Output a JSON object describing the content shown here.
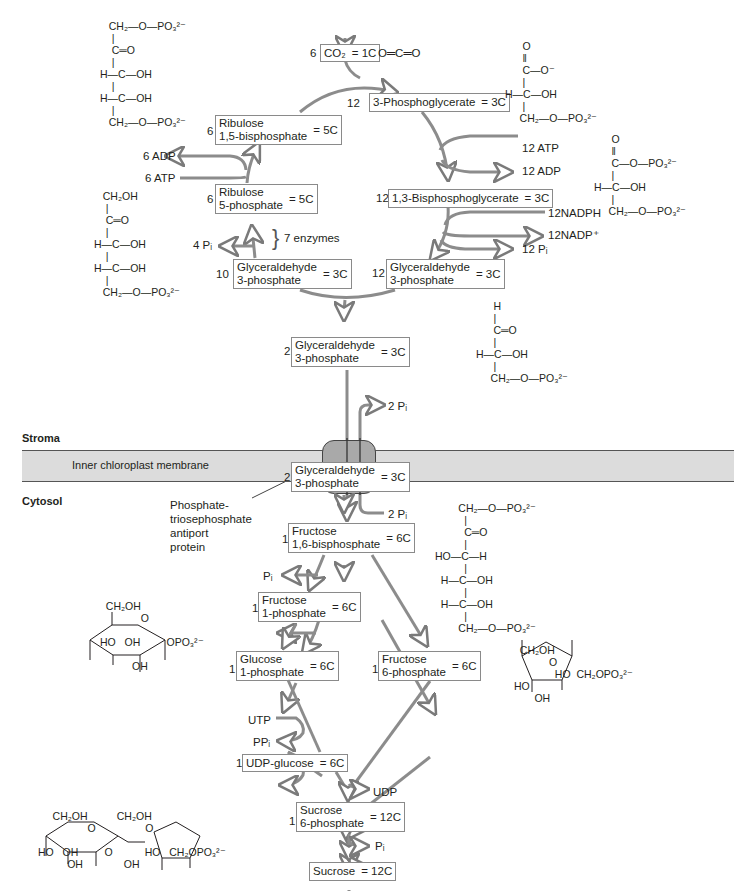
{
  "regions": {
    "stroma": "Stroma",
    "cytosol": "Cytosol",
    "membrane": "Inner chloroplast membrane",
    "antiport_label": [
      "Phosphate-",
      "triosephosphate",
      "antiport",
      "protein"
    ]
  },
  "calvin_cycle": {
    "co2": {
      "coef": "6",
      "name": "CO₂",
      "eq": "= 1C",
      "structure": "O═C═O"
    },
    "pga": {
      "coef": "12",
      "name": "3-Phosphoglycerate",
      "eq": "= 3C"
    },
    "bpg": {
      "coef": "12",
      "name": "1,3-Bisphosphoglycerate",
      "eq": "= 3C"
    },
    "g3p12": {
      "coef": "12",
      "name1": "Glyceraldehyde",
      "name2": "3-phosphate",
      "eq": "= 3C"
    },
    "g3p10": {
      "coef": "10",
      "name1": "Glyceraldehyde",
      "name2": "3-phosphate",
      "eq": "= 3C"
    },
    "ru5p": {
      "coef": "6",
      "name1": "Ribulose",
      "name2": "5-phosphate",
      "eq": "= 5C"
    },
    "rubp": {
      "coef": "6",
      "name1": "Ribulose",
      "name2": "1,5-bisphosphate",
      "eq": "= 5C"
    },
    "side": {
      "atp12": "12 ATP",
      "adp12": "12 ADP",
      "nadph": "12NADPH",
      "nadp": "12NADP⁺",
      "pi12": "12 Pᵢ",
      "adp6": "6 ADP",
      "atp6": "6 ATP",
      "pi4": "4 Pᵢ",
      "enzymes": "7 enzymes"
    }
  },
  "export": {
    "g3p_stroma": {
      "coef": "2",
      "name1": "Glyceraldehyde",
      "name2": "3-phosphate",
      "eq": "= 3C"
    },
    "pi_out": "2 Pᵢ",
    "pi_in": "2 Pᵢ",
    "g3p_cytosol": {
      "coef": "2",
      "name1": "Glyceraldehyde",
      "name2": "3-phosphate",
      "eq": "= 3C"
    }
  },
  "sucrose_pathway": {
    "f16bp": {
      "coef": "1",
      "name1": "Fructose",
      "name2": "1,6-bisphosphate",
      "eq": "= 6C"
    },
    "pi_f": "Pᵢ",
    "f1p": {
      "coef": "1",
      "name1": "Fructose",
      "name2": "1-phosphate",
      "eq": "= 6C"
    },
    "g1p": {
      "coef": "1",
      "name1": "Glucose",
      "name2": "1-phosphate",
      "eq": "= 6C"
    },
    "f6p": {
      "coef": "1",
      "name1": "Fructose",
      "name2": "6-phosphate",
      "eq": "= 6C"
    },
    "utp": "UTP",
    "ppi": "PPᵢ",
    "udpg": {
      "coef": "1",
      "name": "UDP-glucose",
      "eq": "= 6C"
    },
    "udp": "UDP",
    "s6p": {
      "coef": "1",
      "name1": "Sucrose",
      "name2": "6-phosphate",
      "eq": "= 12C"
    },
    "pi_s": "Pᵢ",
    "sucrose": {
      "name": "Sucrose",
      "eq": "= 12C"
    }
  },
  "colors": {
    "arrow": "#8c8c8c",
    "box_border": "#8a8a8a",
    "membrane": "#dcdcdc",
    "protein": "#a9a9a9",
    "text": "#231f20"
  }
}
